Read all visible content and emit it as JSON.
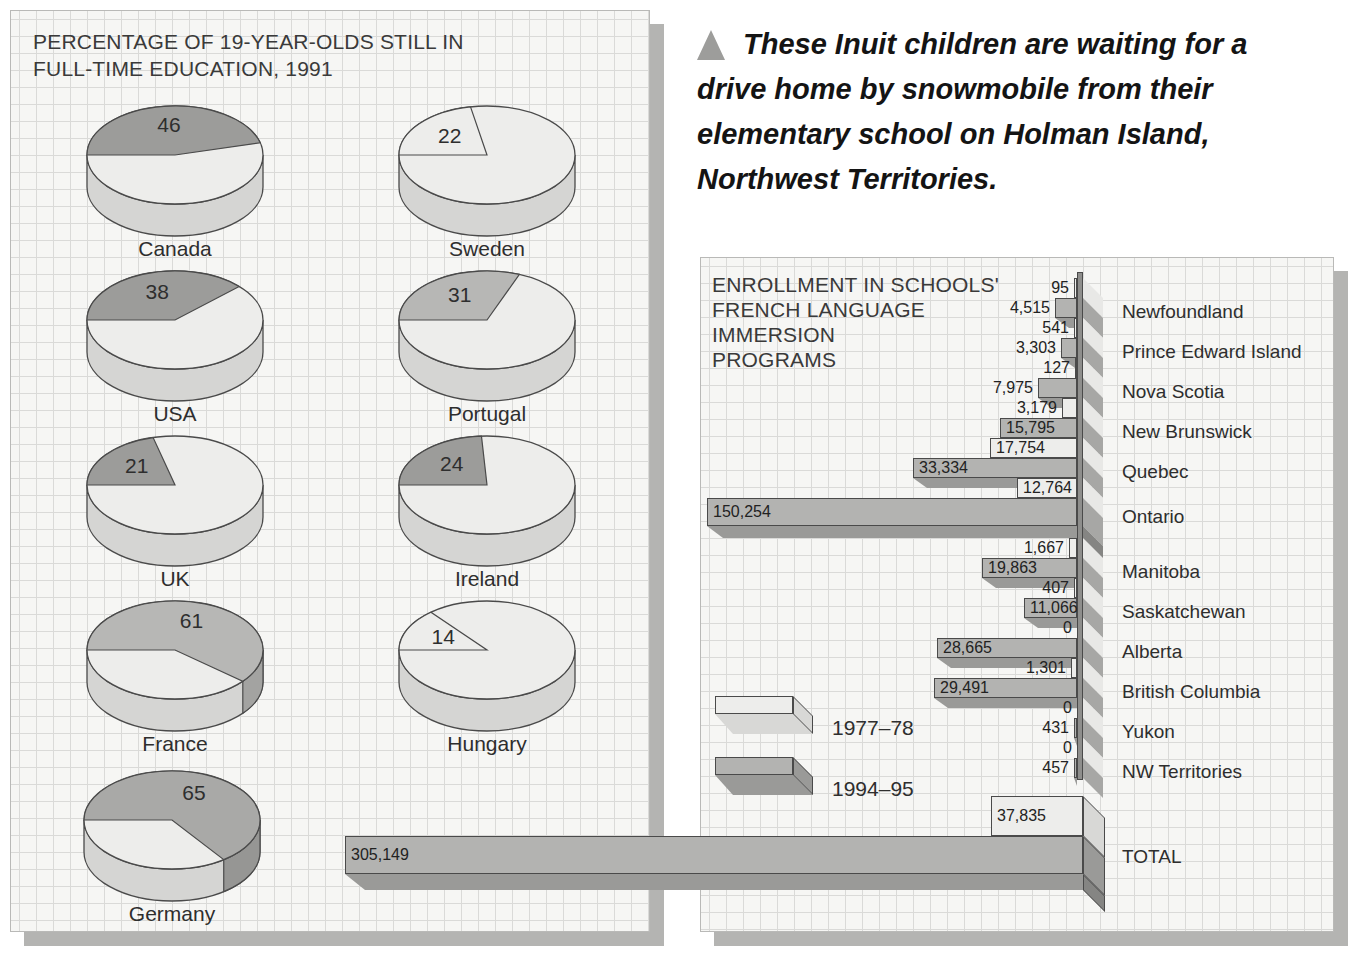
{
  "left_panel": {
    "title_lines": [
      "PERCENTAGE OF 19-YEAR-OLDS STILL IN",
      "FULL-TIME EDUCATION, 1991"
    ]
  },
  "caption": {
    "marker": "triangle-up",
    "lines": [
      "These Inuit children are waiting for a",
      "drive home by snowmobile from their",
      "elementary school on Holman Island,",
      "Northwest Territories."
    ]
  },
  "right_panel": {
    "title_lines": [
      "ENROLLMENT IN SCHOOLS'",
      "FRENCH LANGUAGE",
      "IMMERSION",
      "PROGRAMS"
    ]
  },
  "legend": {
    "items": [
      {
        "label": "1977–78",
        "series": "1977-78",
        "swatch": "light"
      },
      {
        "label": "1994–95",
        "series": "1994-95",
        "swatch": "dark"
      }
    ]
  },
  "chart_data": [
    {
      "type": "pie",
      "title": "PERCENTAGE OF 19-YEAR-OLDS STILL IN FULL-TIME EDUCATION, 1991",
      "unit": "percent of 19-year-olds",
      "pies": [
        {
          "label": "Canada",
          "value": 46
        },
        {
          "label": "Sweden",
          "value": 22
        },
        {
          "label": "USA",
          "value": 38
        },
        {
          "label": "Portugal",
          "value": 31
        },
        {
          "label": "UK",
          "value": 21
        },
        {
          "label": "Ireland",
          "value": 24
        },
        {
          "label": "France",
          "value": 61
        },
        {
          "label": "Hungary",
          "value": 14
        },
        {
          "label": "Germany",
          "value": 65
        }
      ]
    },
    {
      "type": "bar",
      "title": "ENROLLMENT IN SCHOOLS' FRENCH LANGUAGE IMMERSION PROGRAMS",
      "orientation": "horizontal-right-aligned",
      "legend_position": "middle-left",
      "categories": [
        "Newfoundland",
        "Prince Edward Island",
        "Nova Scotia",
        "New Brunswick",
        "Quebec",
        "Ontario",
        "Manitoba",
        "Saskatchewan",
        "Alberta",
        "British Columbia",
        "Yukon",
        "NW Territories",
        "TOTAL"
      ],
      "series": [
        {
          "name": "1977–78",
          "values": [
            95,
            541,
            127,
            3179,
            17754,
            12764,
            1667,
            407,
            0,
            1301,
            0,
            0,
            37835
          ]
        },
        {
          "name": "1994–95",
          "values": [
            4515,
            3303,
            7975,
            15795,
            33334,
            150254,
            19863,
            11066,
            28665,
            29491,
            431,
            457,
            305149
          ]
        }
      ]
    }
  ],
  "colors": {
    "bar_light": "#ededeb",
    "bar_dark": "#b3b3b1",
    "band_dark": "#9a9a98",
    "band_light": "#d8d8d6",
    "band_deep": "#858583",
    "outline": "#4a4a4a",
    "stripe_light": "#e8e8e6",
    "stripe_dark": "#a7a7a5",
    "axis_edge": "#8e8e8c",
    "pie_base": "#ededeb",
    "pie_side": "#d5d5d3",
    "slice_dark": "#9c9c9a",
    "slice_mid": "#b7b7b5",
    "slice_mid2": "#a9a9a7",
    "rim_dark": "#8c8c8a",
    "rim_mid": "#a3a3a1",
    "rim_mid2": "#969694",
    "rim_base": "#cfcfcd",
    "shadow": "#b4b4b2",
    "triangle": "#9d9d9b",
    "text": "#2e2e2e"
  },
  "pie_display": {
    "rx": 88,
    "ry": 49,
    "depth": 32,
    "items": [
      {
        "cx": 175,
        "cy": 155,
        "slice": "dark"
      },
      {
        "cx": 487,
        "cy": 155,
        "slice": "base"
      },
      {
        "cx": 175,
        "cy": 320,
        "slice": "dark"
      },
      {
        "cx": 487,
        "cy": 320,
        "slice": "mid"
      },
      {
        "cx": 175,
        "cy": 485,
        "slice": "dark"
      },
      {
        "cx": 487,
        "cy": 485,
        "slice": "dark"
      },
      {
        "cx": 175,
        "cy": 650,
        "slice": "mid"
      },
      {
        "cx": 487,
        "cy": 650,
        "slice": "base"
      },
      {
        "cx": 172,
        "cy": 820,
        "slice": "mid2"
      }
    ]
  },
  "bar_display": {
    "axis_x": 1077,
    "stripe_x": 1083,
    "stripe_w": 20,
    "edge_strip": {
      "x": 1077,
      "y": 272,
      "w": 6,
      "h": 508
    },
    "rows": [
      {
        "c": 0,
        "s": 0,
        "label": "95",
        "w": 3,
        "y": 278,
        "h": 20,
        "in": false
      },
      {
        "c": 0,
        "s": 1,
        "label": "4,515",
        "w": 22,
        "y": 298,
        "h": 20,
        "in": false,
        "band": 10
      },
      {
        "c": 1,
        "s": 0,
        "label": "541",
        "w": 3,
        "y": 318,
        "h": 20,
        "in": false
      },
      {
        "c": 1,
        "s": 1,
        "label": "3,303",
        "w": 16,
        "y": 338,
        "h": 20,
        "in": false,
        "band": 10
      },
      {
        "c": 2,
        "s": 0,
        "label": "127",
        "w": 2,
        "y": 358,
        "h": 20,
        "in": false
      },
      {
        "c": 2,
        "s": 1,
        "label": "7,975",
        "w": 39,
        "y": 378,
        "h": 20,
        "in": false,
        "band": 10
      },
      {
        "c": 3,
        "s": 0,
        "label": "3,179",
        "w": 15,
        "y": 398,
        "h": 20,
        "in": false
      },
      {
        "c": 3,
        "s": 1,
        "label": "15,795",
        "w": 77,
        "y": 418,
        "h": 20,
        "in": true,
        "band": 10
      },
      {
        "c": 4,
        "s": 0,
        "label": "17,754",
        "w": 87,
        "y": 438,
        "h": 20,
        "in": true
      },
      {
        "c": 4,
        "s": 1,
        "label": "33,334",
        "w": 164,
        "y": 458,
        "h": 20,
        "in": true,
        "band": 10
      },
      {
        "c": 5,
        "s": 0,
        "label": "12,764",
        "w": 60,
        "y": 478,
        "h": 20,
        "in": true
      },
      {
        "c": 5,
        "s": 1,
        "label": "150,254",
        "w": 370,
        "y": 498,
        "h": 28,
        "in": true,
        "band": 12
      },
      {
        "c": 6,
        "s": 0,
        "label": "1,667",
        "w": 8,
        "y": 538,
        "h": 20,
        "in": false
      },
      {
        "c": 6,
        "s": 1,
        "label": "19,863",
        "w": 95,
        "y": 558,
        "h": 20,
        "in": true,
        "band": 10
      },
      {
        "c": 7,
        "s": 0,
        "label": "407",
        "w": 3,
        "y": 578,
        "h": 20,
        "in": false
      },
      {
        "c": 7,
        "s": 1,
        "label": "11,066",
        "w": 53,
        "y": 598,
        "h": 20,
        "in": true,
        "band": 10
      },
      {
        "c": 8,
        "s": 0,
        "label": "0",
        "w": 0,
        "y": 618,
        "h": 20,
        "in": false
      },
      {
        "c": 8,
        "s": 1,
        "label": "28,665",
        "w": 140,
        "y": 638,
        "h": 20,
        "in": true,
        "band": 10
      },
      {
        "c": 9,
        "s": 0,
        "label": "1,301",
        "w": 6,
        "y": 658,
        "h": 20,
        "in": false
      },
      {
        "c": 9,
        "s": 1,
        "label": "29,491",
        "w": 143,
        "y": 678,
        "h": 20,
        "in": true,
        "band": 10
      },
      {
        "c": 10,
        "s": 0,
        "label": "0",
        "w": 0,
        "y": 698,
        "h": 20,
        "in": false
      },
      {
        "c": 10,
        "s": 1,
        "label": "431",
        "w": 3,
        "y": 718,
        "h": 20,
        "in": false,
        "band": 8
      },
      {
        "c": 11,
        "s": 0,
        "label": "0",
        "w": 0,
        "y": 738,
        "h": 20,
        "in": false
      },
      {
        "c": 11,
        "s": 1,
        "label": "457",
        "w": 3,
        "y": 758,
        "h": 20,
        "in": false,
        "band": 8
      },
      {
        "c": 12,
        "s": 0,
        "label": "37,835",
        "w": 92,
        "y": 796,
        "h": 40,
        "in": true,
        "r": 1083
      },
      {
        "c": 12,
        "s": 1,
        "label": "305,149",
        "w": 738,
        "y": 836,
        "h": 38,
        "in": true,
        "band": 16,
        "r": 1083
      }
    ],
    "extra_stripes": [
      {
        "y": 526,
        "h": 12,
        "tone": "deep"
      }
    ],
    "total_caps": [
      {
        "y": 796,
        "h": 40,
        "tone": "light"
      },
      {
        "y": 836,
        "h": 38,
        "tone": "dark"
      },
      {
        "y": 874,
        "h": 16,
        "tone": "deep"
      }
    ],
    "cat_labels": [
      {
        "t": "Newfoundland",
        "y": 301
      },
      {
        "t": "Prince Edward Island",
        "y": 341
      },
      {
        "t": "Nova Scotia",
        "y": 381
      },
      {
        "t": "New Brunswick",
        "y": 421
      },
      {
        "t": "Quebec",
        "y": 461
      },
      {
        "t": "Ontario",
        "y": 506
      },
      {
        "t": "Manitoba",
        "y": 561
      },
      {
        "t": "Saskatchewan",
        "y": 601
      },
      {
        "t": "Alberta",
        "y": 641
      },
      {
        "t": "British Columbia",
        "y": 681
      },
      {
        "t": "Yukon",
        "y": 721
      },
      {
        "t": "NW Territories",
        "y": 761
      },
      {
        "t": "TOTAL",
        "y": 846
      }
    ],
    "cat_label_x": 1122,
    "legend_geo": {
      "x": 715,
      "w": 78,
      "h": 18,
      "band": 20,
      "cap": 20,
      "y": [
        696,
        757
      ],
      "label_x": 832,
      "label_y": [
        716,
        777
      ]
    }
  }
}
